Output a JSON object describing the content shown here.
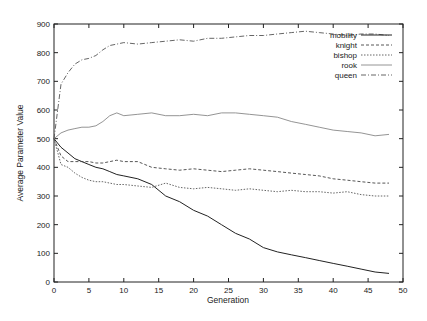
{
  "chart_data": {
    "type": "line",
    "title": "",
    "xlabel": "Generation",
    "ylabel": "Average Parameter Value",
    "xlim": [
      0,
      50
    ],
    "ylim": [
      0,
      900
    ],
    "xticks": [
      0,
      5,
      10,
      15,
      20,
      25,
      30,
      35,
      40,
      45,
      50
    ],
    "yticks": [
      0,
      100,
      200,
      300,
      400,
      500,
      600,
      700,
      800,
      900
    ],
    "grid": false,
    "legend_position": "top-right",
    "x": [
      0,
      1,
      2,
      3,
      4,
      5,
      6,
      7,
      8,
      9,
      10,
      12,
      14,
      16,
      18,
      20,
      22,
      24,
      26,
      28,
      30,
      32,
      34,
      36,
      38,
      40,
      42,
      44,
      46,
      48
    ],
    "series": [
      {
        "name": "mobility",
        "style": "solid",
        "values": [
          500,
          470,
          450,
          430,
          420,
          410,
          400,
          395,
          385,
          375,
          370,
          360,
          340,
          300,
          280,
          250,
          230,
          200,
          170,
          150,
          120,
          105,
          95,
          85,
          75,
          65,
          55,
          45,
          35,
          30
        ]
      },
      {
        "name": "knight",
        "style": "dashed",
        "values": [
          500,
          440,
          420,
          420,
          420,
          420,
          415,
          415,
          420,
          425,
          420,
          420,
          400,
          395,
          390,
          395,
          390,
          385,
          390,
          395,
          390,
          385,
          380,
          375,
          370,
          360,
          355,
          350,
          345,
          345
        ]
      },
      {
        "name": "bishop",
        "style": "dotted",
        "values": [
          500,
          410,
          400,
          380,
          365,
          355,
          350,
          350,
          345,
          340,
          340,
          335,
          330,
          345,
          330,
          325,
          330,
          325,
          320,
          325,
          320,
          315,
          320,
          315,
          315,
          310,
          315,
          305,
          300,
          300
        ]
      },
      {
        "name": "rook",
        "style": "light-solid",
        "values": [
          500,
          520,
          530,
          535,
          540,
          540,
          545,
          560,
          580,
          590,
          580,
          585,
          590,
          580,
          580,
          585,
          580,
          590,
          590,
          585,
          580,
          575,
          560,
          550,
          540,
          530,
          525,
          520,
          510,
          515
        ]
      },
      {
        "name": "queen",
        "style": "dash-dot",
        "values": [
          500,
          690,
          730,
          760,
          775,
          780,
          790,
          810,
          825,
          830,
          835,
          830,
          835,
          840,
          845,
          840,
          850,
          850,
          855,
          860,
          860,
          865,
          870,
          875,
          870,
          865,
          860,
          865,
          865,
          860
        ]
      }
    ]
  },
  "axes": {
    "xlabel": "Generation",
    "ylabel": "Average Parameter Value",
    "xtick_labels": [
      "0",
      "5",
      "10",
      "15",
      "20",
      "25",
      "30",
      "35",
      "40",
      "45",
      "50"
    ],
    "ytick_labels": [
      "0",
      "100",
      "200",
      "300",
      "400",
      "500",
      "600",
      "700",
      "800",
      "900"
    ]
  },
  "legend": [
    {
      "label": "mobility"
    },
    {
      "label": "knight"
    },
    {
      "label": "bishop"
    },
    {
      "label": "rook"
    },
    {
      "label": "queen"
    }
  ]
}
